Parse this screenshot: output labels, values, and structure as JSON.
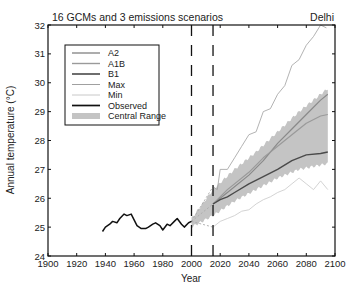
{
  "chart_data": {
    "type": "line",
    "title": "16 GCMs and 3 emissions scenarios",
    "location_label": "Delhi",
    "xlabel": "Year",
    "ylabel": "Annual temperature (°C)",
    "xlim": [
      1900,
      2100
    ],
    "ylim": [
      24,
      32
    ],
    "xticks": [
      1900,
      1920,
      1940,
      1960,
      1980,
      2000,
      2020,
      2040,
      2060,
      2080,
      2100
    ],
    "yticks": [
      24,
      25,
      26,
      27,
      28,
      29,
      30,
      31,
      32
    ],
    "grid": false,
    "legend_position": "upper-left",
    "vertical_dashed_lines": [
      2000,
      2015
    ],
    "series": [
      {
        "name": "A2",
        "color": "#8a8a8a",
        "width": 1.2,
        "x": [
          2015,
          2025,
          2040,
          2050,
          2060,
          2070,
          2080,
          2090,
          2095
        ],
        "values": [
          25.8,
          26.2,
          26.8,
          27.3,
          27.9,
          28.4,
          28.9,
          29.4,
          29.6
        ]
      },
      {
        "name": "A1B",
        "color": "#9a9a9a",
        "width": 1.2,
        "x": [
          2015,
          2025,
          2040,
          2050,
          2060,
          2070,
          2080,
          2090,
          2095
        ],
        "values": [
          25.8,
          26.3,
          26.9,
          27.4,
          27.8,
          28.2,
          28.6,
          28.85,
          28.9
        ]
      },
      {
        "name": "B1",
        "color": "#4a4a4a",
        "width": 1.4,
        "x": [
          2015,
          2020,
          2025,
          2030,
          2040,
          2050,
          2060,
          2070,
          2080,
          2090,
          2095
        ],
        "values": [
          25.8,
          25.95,
          26.05,
          26.2,
          26.5,
          26.75,
          27.0,
          27.3,
          27.5,
          27.55,
          27.6
        ]
      },
      {
        "name": "Max",
        "color": "#a0a0a0",
        "width": 0.8,
        "x": [
          2015,
          2018,
          2020,
          2025,
          2030,
          2035,
          2040,
          2045,
          2050,
          2055,
          2060,
          2065,
          2070,
          2075,
          2080,
          2085,
          2090,
          2094
        ],
        "values": [
          26.4,
          26.3,
          27.0,
          27.0,
          27.4,
          27.8,
          28.2,
          28.3,
          29.0,
          29.1,
          29.6,
          29.9,
          30.6,
          30.8,
          31.3,
          31.6,
          32.0,
          31.9
        ]
      },
      {
        "name": "Min",
        "color": "#c8c8c8",
        "width": 0.8,
        "x": [
          2015,
          2020,
          2025,
          2030,
          2035,
          2040,
          2045,
          2050,
          2055,
          2060,
          2065,
          2070,
          2075,
          2080,
          2085,
          2090,
          2095
        ],
        "values": [
          25.0,
          25.2,
          25.3,
          25.4,
          25.55,
          25.6,
          25.8,
          25.95,
          26.05,
          26.2,
          26.3,
          26.5,
          26.7,
          26.5,
          26.3,
          26.6,
          26.3
        ]
      },
      {
        "name": "Observed",
        "color": "#111111",
        "width": 1.5,
        "x": [
          1938,
          1940,
          1943,
          1945,
          1948,
          1950,
          1953,
          1955,
          1958,
          1960,
          1962,
          1965,
          1968,
          1970,
          1973,
          1975,
          1978,
          1980,
          1983,
          1985,
          1988,
          1990,
          1993,
          1995,
          1998,
          2000
        ],
        "values": [
          24.85,
          25.0,
          25.1,
          25.2,
          25.15,
          25.3,
          25.45,
          25.4,
          25.45,
          25.25,
          25.05,
          24.95,
          24.95,
          25.0,
          25.1,
          25.15,
          25.05,
          24.9,
          25.1,
          25.05,
          25.2,
          25.3,
          25.1,
          25.0,
          25.15,
          25.2
        ]
      }
    ],
    "central_range": {
      "name": "Central Range",
      "color": "#c4c4c4",
      "x": [
        2000,
        2015,
        2030,
        2045,
        2060,
        2075,
        2095
      ],
      "lower": [
        25.0,
        25.4,
        25.9,
        26.3,
        26.7,
        27.0,
        27.2
      ],
      "upper": [
        25.3,
        26.3,
        27.0,
        27.6,
        28.3,
        29.0,
        29.8
      ]
    },
    "transition_dashed": {
      "x0": 2000,
      "y0": 25.2,
      "x1": 2015,
      "targets": [
        26.4,
        25.8,
        25.0
      ],
      "color": "#aaaaaa"
    }
  }
}
